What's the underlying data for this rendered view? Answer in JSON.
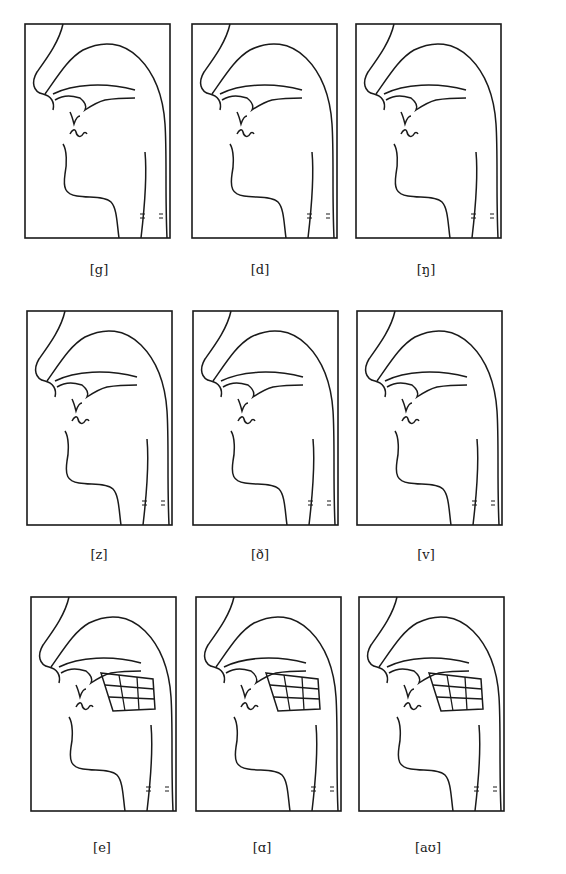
{
  "figure": {
    "line_color": "#1a1a1a",
    "background": "#ffffff",
    "rows": [
      {
        "panels": [
          {
            "label": "[g]",
            "vowel_grid": false
          },
          {
            "label": "[d]",
            "vowel_grid": false
          },
          {
            "label": "[ŋ]",
            "vowel_grid": false
          }
        ]
      },
      {
        "panels": [
          {
            "label": "[z]",
            "vowel_grid": false
          },
          {
            "label": "[ð]",
            "vowel_grid": false
          },
          {
            "label": "[v]",
            "vowel_grid": false
          }
        ]
      },
      {
        "panels": [
          {
            "label": "[e]",
            "vowel_grid": true
          },
          {
            "label": "[ɑ]",
            "vowel_grid": true
          },
          {
            "label": "[aʊ]",
            "vowel_grid": true
          }
        ]
      }
    ]
  }
}
